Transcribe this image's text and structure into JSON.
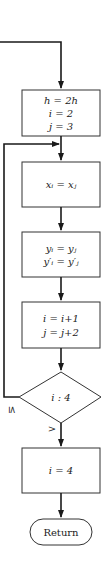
{
  "diagram": {
    "type": "flowchart",
    "nodes": {
      "init": {
        "lines": [
          "h = 2h",
          "i = 2",
          "j = 3"
        ]
      },
      "assign_x": {
        "lines": [
          "xᵢ = xⱼ"
        ]
      },
      "assign_y": {
        "lines": [
          "yᵢ = yⱼ",
          "y′ᵢ = y′ⱼ"
        ]
      },
      "increment": {
        "lines": [
          "i = i+1",
          "j = j+2"
        ]
      },
      "decision": {
        "label": "i : 4"
      },
      "set_i": {
        "lines": [
          "i = 4"
        ]
      },
      "terminal": {
        "label": "Return"
      }
    },
    "edge_labels": {
      "loop_back": "≤",
      "exit": ">"
    },
    "colors": {
      "stroke": "#1a1a1a",
      "background": "#ffffff"
    }
  }
}
